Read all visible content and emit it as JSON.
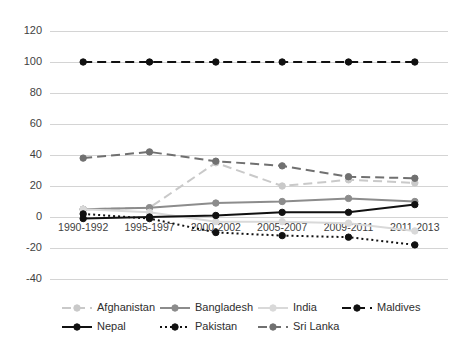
{
  "chart_data": {
    "type": "line",
    "title": "",
    "subtitle": "",
    "xlabel": "",
    "ylabel": "",
    "grid": true,
    "legend_position": "bottom",
    "ylim": [
      -40,
      120
    ],
    "yticks": [
      -40,
      -20,
      0,
      20,
      40,
      60,
      80,
      100,
      120
    ],
    "ytick_labels": [
      "-40",
      "-20",
      "0",
      "20",
      "40",
      "60",
      "80",
      "100",
      "120"
    ],
    "categories": [
      "1990-1992",
      "1995-1997",
      "2000-2002",
      "2005-2007",
      "2009-2011",
      "2011-2013"
    ],
    "series": [
      {
        "name": "Afghanistan",
        "values": [
          5,
          6,
          35,
          20,
          24,
          22
        ],
        "color": "#c9c9c9",
        "style": "dashed",
        "marker": "circle"
      },
      {
        "name": "Bangladesh",
        "values": [
          5,
          6,
          9,
          10,
          12,
          10
        ],
        "color": "#8c8c8c",
        "style": "solid",
        "marker": "circle"
      },
      {
        "name": "India",
        "values": [
          5,
          3,
          -3,
          -3,
          -4,
          -9
        ],
        "color": "#d9d9d9",
        "style": "solid",
        "marker": "circle"
      },
      {
        "name": "Maldives",
        "values": [
          100,
          100,
          100,
          100,
          100,
          100
        ],
        "color": "#111111",
        "style": "dashed",
        "marker": "circle"
      },
      {
        "name": "Nepal",
        "values": [
          -1,
          0,
          1,
          3,
          3,
          8
        ],
        "color": "#111111",
        "style": "solid",
        "marker": "circle"
      },
      {
        "name": "Pakistan",
        "values": [
          2,
          -1,
          -10,
          -12,
          -13,
          -18
        ],
        "color": "#111111",
        "style": "dotted",
        "marker": "circle"
      },
      {
        "name": "Sri Lanka",
        "values": [
          38,
          42,
          36,
          33,
          26,
          25
        ],
        "color": "#707070",
        "style": "dashed",
        "marker": "circle"
      }
    ]
  },
  "legend": {
    "row1": [
      "Afghanistan",
      "Bangladesh",
      "India",
      "Maldives"
    ],
    "row2": [
      "Nepal",
      "Pakistan",
      "Sri Lanka"
    ]
  }
}
